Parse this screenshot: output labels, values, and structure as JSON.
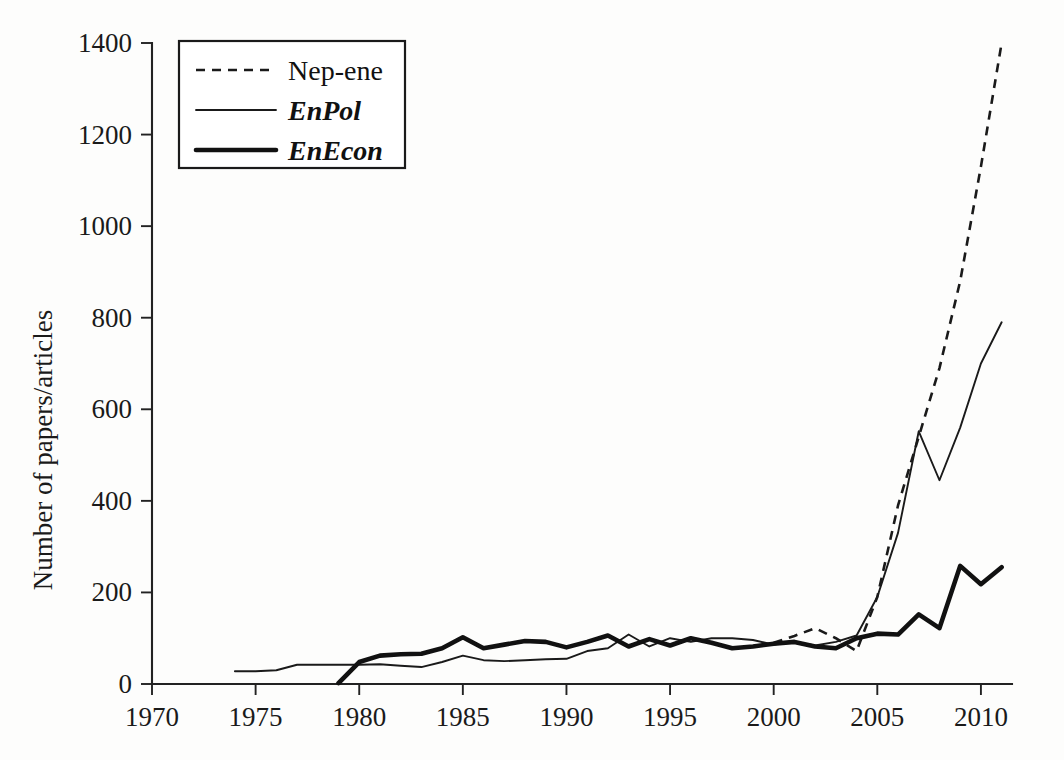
{
  "chart_data": {
    "type": "line",
    "title": "",
    "xlabel": "",
    "ylabel": "Number of papers/articles",
    "xlim": [
      1970,
      2011.5
    ],
    "ylim": [
      0,
      1400
    ],
    "xticks": [
      1970,
      1975,
      1980,
      1985,
      1990,
      1995,
      2000,
      2005,
      2010
    ],
    "xtick_labels": [
      "1970",
      "1975",
      "1980",
      "1985",
      "1990",
      "1995",
      "2000",
      "2005",
      "2010"
    ],
    "yticks": [
      0,
      200,
      400,
      600,
      800,
      1000,
      1200,
      1400
    ],
    "ytick_labels": [
      "0",
      "200",
      "400",
      "600",
      "800",
      "1000",
      "1200",
      "1400"
    ],
    "grid": false,
    "legend_position": "upper-left",
    "series": [
      {
        "name": "Nep-ene",
        "style": "dashed",
        "x": [
          2000,
          2001,
          2002,
          2003,
          2004,
          2005,
          2006,
          2007,
          2008,
          2009,
          2010,
          2011
        ],
        "values": [
          90,
          105,
          122,
          100,
          72,
          190,
          390,
          540,
          690,
          880,
          1130,
          1400
        ]
      },
      {
        "name": "EnPol",
        "style": "solid-thin",
        "x": [
          1974,
          1975,
          1976,
          1977,
          1978,
          1979,
          1980,
          1981,
          1982,
          1983,
          1984,
          1985,
          1986,
          1987,
          1988,
          1989,
          1990,
          1991,
          1992,
          1993,
          1994,
          1995,
          1996,
          1997,
          1998,
          1999,
          2000,
          2001,
          2002,
          2003,
          2004,
          2005,
          2006,
          2007,
          2008,
          2009,
          2010,
          2011
        ],
        "values": [
          28,
          28,
          30,
          42,
          42,
          42,
          42,
          43,
          40,
          37,
          48,
          62,
          52,
          50,
          52,
          54,
          55,
          72,
          78,
          108,
          82,
          100,
          92,
          100,
          100,
          96,
          86,
          92,
          84,
          92,
          106,
          190,
          330,
          552,
          445,
          560,
          700,
          790
        ]
      },
      {
        "name": "EnEcon",
        "style": "solid-thick",
        "x": [
          1979,
          1980,
          1981,
          1982,
          1983,
          1984,
          1985,
          1986,
          1987,
          1988,
          1989,
          1990,
          1991,
          1992,
          1993,
          1994,
          1995,
          1996,
          1997,
          1998,
          1999,
          2000,
          2001,
          2002,
          2003,
          2004,
          2005,
          2006,
          2007,
          2008,
          2009,
          2010,
          2011
        ],
        "values": [
          2,
          48,
          62,
          65,
          66,
          78,
          102,
          78,
          86,
          94,
          92,
          80,
          92,
          106,
          82,
          98,
          84,
          100,
          90,
          78,
          82,
          88,
          92,
          82,
          78,
          100,
          110,
          108,
          152,
          122,
          258,
          218,
          255
        ]
      }
    ]
  },
  "legend": {
    "entries": [
      {
        "label": "Nep-ene",
        "style": "dashed",
        "italic": false
      },
      {
        "label": "EnPol",
        "style": "solid-thin",
        "italic": true
      },
      {
        "label": "EnEcon",
        "style": "solid-thick",
        "italic": true
      }
    ]
  },
  "axes": {
    "y_axis_title": "Number of papers/articles"
  }
}
